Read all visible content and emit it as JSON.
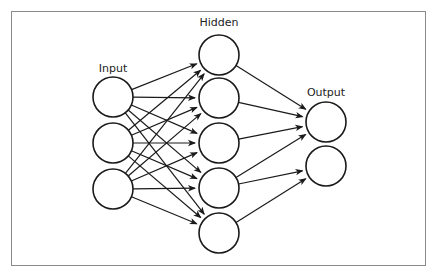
{
  "diagram": {
    "type": "neural-network",
    "colors": {
      "stroke": "#1a1a1a",
      "frame": "#8a8a8a",
      "background": "#ffffff"
    },
    "layers": [
      {
        "id": "input",
        "label": "Input",
        "label_pos": [
          113,
          72
        ],
        "nodes": [
          {
            "id": "i1",
            "cx": 113,
            "cy": 97
          },
          {
            "id": "i2",
            "cx": 113,
            "cy": 143
          },
          {
            "id": "i3",
            "cx": 113,
            "cy": 189
          }
        ]
      },
      {
        "id": "hidden",
        "label": "Hidden",
        "label_pos": [
          219,
          26
        ],
        "nodes": [
          {
            "id": "h1",
            "cx": 219,
            "cy": 55
          },
          {
            "id": "h2",
            "cx": 219,
            "cy": 98
          },
          {
            "id": "h3",
            "cx": 219,
            "cy": 143
          },
          {
            "id": "h4",
            "cx": 219,
            "cy": 188
          },
          {
            "id": "h5",
            "cx": 219,
            "cy": 233
          }
        ]
      },
      {
        "id": "output",
        "label": "Output",
        "label_pos": [
          326,
          96
        ],
        "nodes": [
          {
            "id": "o1",
            "cx": 326,
            "cy": 122
          },
          {
            "id": "o2",
            "cx": 326,
            "cy": 166
          }
        ]
      }
    ],
    "node_radius": 20,
    "edges": [
      [
        "i1",
        "h1"
      ],
      [
        "i1",
        "h2"
      ],
      [
        "i1",
        "h3"
      ],
      [
        "i1",
        "h4"
      ],
      [
        "i1",
        "h5"
      ],
      [
        "i2",
        "h1"
      ],
      [
        "i2",
        "h2"
      ],
      [
        "i2",
        "h3"
      ],
      [
        "i2",
        "h4"
      ],
      [
        "i2",
        "h5"
      ],
      [
        "i3",
        "h1"
      ],
      [
        "i3",
        "h2"
      ],
      [
        "i3",
        "h3"
      ],
      [
        "i3",
        "h4"
      ],
      [
        "i3",
        "h5"
      ],
      [
        "h1",
        "o1"
      ],
      [
        "h2",
        "o1"
      ],
      [
        "h3",
        "o1"
      ],
      [
        "h4",
        "o1"
      ],
      [
        "h4",
        "o2"
      ],
      [
        "h5",
        "o2"
      ]
    ]
  }
}
